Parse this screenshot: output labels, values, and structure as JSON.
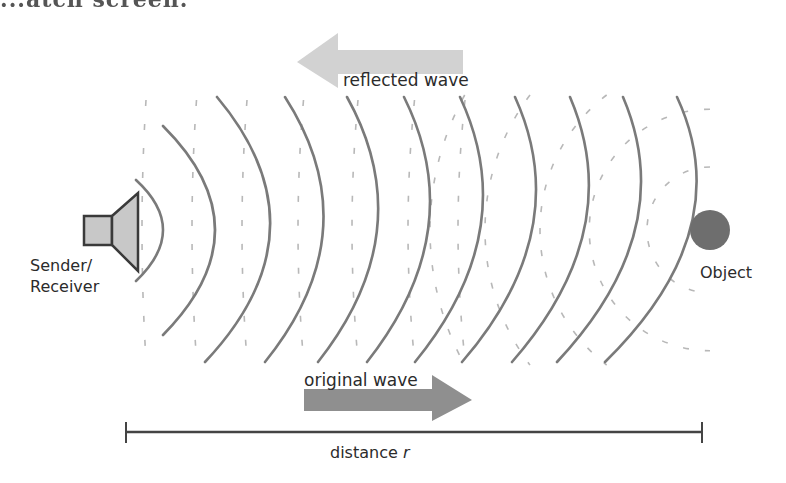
{
  "page": {
    "cropped_header_text": "...atch screen."
  },
  "diagram": {
    "labels": {
      "reflected_wave": "reflected wave",
      "original_wave": "original wave",
      "sender_line1": "Sender/",
      "sender_line2": "Receiver",
      "object": "Object",
      "distance": "distance ",
      "distance_var": "r"
    },
    "colors": {
      "solid_wave": "#7a7a7a",
      "dashed_wave": "#b8b8b8",
      "reflected_arrow": "#d2d2d2",
      "original_arrow": "#8f8f8f",
      "speaker_fill": "#c8c8c8",
      "speaker_stroke": "#3a3a3a",
      "object_fill": "#6e6e6e",
      "ruler": "#444444",
      "text": "#2b2b2b"
    },
    "solid_wave_count": 10,
    "dashed_wave_count": 10
  }
}
